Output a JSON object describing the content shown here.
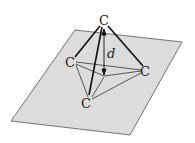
{
  "diagram": {
    "plane_color": "#d9d9d9",
    "line_color": "#1a1a1a",
    "atoms": [
      {
        "label": "C",
        "position": "top"
      },
      {
        "label": "C",
        "position": "left"
      },
      {
        "label": "C",
        "position": "right"
      },
      {
        "label": "C",
        "position": "bottom"
      }
    ],
    "distance_label": "d"
  }
}
